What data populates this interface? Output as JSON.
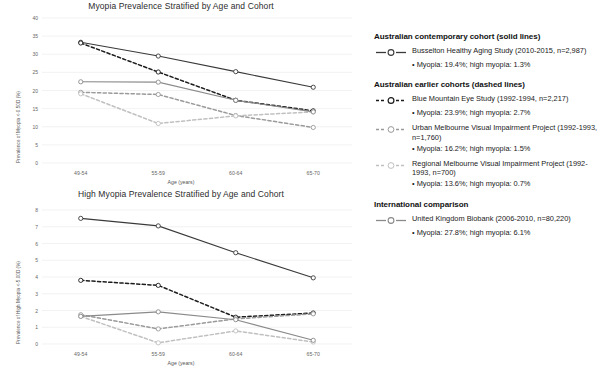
{
  "chart_data": [
    {
      "type": "line",
      "title": "Myopia Prevalence Stratified by Age and Cohort",
      "xlabel": "Age (years)",
      "ylabel": "Prevalence of Myopia <-0.50D (%)",
      "categories": [
        "49-54",
        "55-59",
        "60-64",
        "65-70"
      ],
      "ylim": [
        0,
        40
      ],
      "yticks": [
        0,
        5,
        10,
        15,
        20,
        25,
        30,
        35,
        40
      ],
      "grid": true,
      "legend_position": "right",
      "series": [
        {
          "name": "Busselton Healthy Aging Study",
          "style": "solid",
          "color": "#3a3a3a",
          "values": [
            33.3,
            29.5,
            25.2,
            20.9
          ]
        },
        {
          "name": "Blue Mountain Eye Study",
          "style": "dashed",
          "color": "#1c1c1c",
          "values": [
            33.1,
            25.1,
            17.3,
            14.4
          ]
        },
        {
          "name": "Urban Melbourne Visual Impairment Project",
          "style": "dashed",
          "color": "#9a9a9a",
          "values": [
            19.5,
            18.9,
            13.1,
            9.8
          ]
        },
        {
          "name": "Regional Melbourne Visual Impairment Project",
          "style": "dashed",
          "color": "#c0c0c0",
          "values": [
            19.1,
            10.9,
            13.0,
            14.1
          ]
        },
        {
          "name": "United Kingdom Biobank",
          "style": "solid",
          "color": "#8a8a8a",
          "values": [
            22.4,
            22.3,
            17.3,
            14.1
          ]
        }
      ]
    },
    {
      "type": "line",
      "title": "High Myopia Prevalence Stratified by Age and Cohort",
      "xlabel": "Age (years)",
      "ylabel": "Prevalence of High Myopia <-5.00D (%)",
      "categories": [
        "49-54",
        "55-59",
        "60-64",
        "65-70"
      ],
      "ylim": [
        0,
        8
      ],
      "yticks": [
        0,
        1,
        2,
        3,
        4,
        5,
        6,
        7,
        8
      ],
      "grid": true,
      "legend_position": "right",
      "series": [
        {
          "name": "Busselton Healthy Aging Study",
          "style": "solid",
          "color": "#3a3a3a",
          "values": [
            7.5,
            7.05,
            5.45,
            3.95
          ]
        },
        {
          "name": "Blue Mountain Eye Study",
          "style": "dashed",
          "color": "#1c1c1c",
          "values": [
            3.8,
            3.5,
            1.6,
            1.85
          ]
        },
        {
          "name": "Urban Melbourne Visual Impairment Project",
          "style": "dashed",
          "color": "#9a9a9a",
          "values": [
            1.75,
            0.9,
            1.5,
            1.8
          ]
        },
        {
          "name": "Regional Melbourne Visual Impairment Project",
          "style": "dashed",
          "color": "#c0c0c0",
          "values": [
            1.65,
            0.07,
            0.78,
            0.12
          ]
        },
        {
          "name": "United Kingdom Biobank",
          "style": "solid",
          "color": "#8a8a8a",
          "values": [
            1.65,
            1.92,
            1.45,
            0.22
          ]
        }
      ]
    }
  ],
  "legend": {
    "groups": [
      {
        "heading": "Australian contemporary cohort (solid lines)",
        "entries": [
          {
            "swatch": "solid-dark-marker",
            "label": "Busselton Healthy Aging Study (2010-2015, n=2,987)",
            "stat": "• Myopia: 19.4%; high myopia: 1.3%"
          }
        ]
      },
      {
        "heading": "Australian earlier cohorts (dashed lines)",
        "entries": [
          {
            "swatch": "dashed-dark-marker",
            "label": "Blue Mountain Eye Study (1992-1994, n=2,217)",
            "stat": "• Myopia: 23.9%; high myopia: 2.7%"
          },
          {
            "swatch": "dashed-gray-marker",
            "label": "Urban Melbourne Visual Impairment Project (1992-1993, n=1,760)",
            "stat": "• Myopia: 16.2%; high myopia: 1.5%"
          },
          {
            "swatch": "dashed-lightgray-marker",
            "label": "Regional Melbourne Visual Impairment Project (1992-1993, n=700)",
            "stat": "• Myopia: 13.6%; high myopia: 0.7%"
          }
        ]
      },
      {
        "heading": "International comparison",
        "entries": [
          {
            "swatch": "solid-gray-marker",
            "label": "United Kingdom Biobank (2006-2010, n=80,220)",
            "stat": "• Myopia: 27.8%; high myopia: 6.1%"
          }
        ]
      }
    ]
  },
  "colors": {
    "solid_dark": "#3a3a3a",
    "dashed_dark": "#1c1c1c",
    "dashed_gray": "#9a9a9a",
    "dashed_lightgray": "#c0c0c0",
    "solid_gray": "#8a8a8a",
    "grid": "#ededed",
    "text": "#222222"
  }
}
